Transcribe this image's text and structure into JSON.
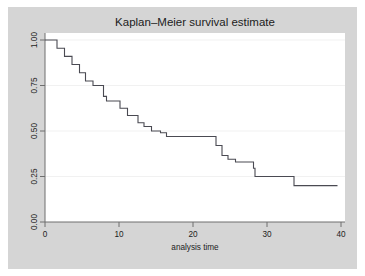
{
  "figure": {
    "title": "Kaplan–Meier survival estimate",
    "background_color": "#d5d5d5",
    "plot_area_color": "#ffffff",
    "outer_margin_color": "#ffffff"
  },
  "axes": {
    "x": {
      "label": "analysis time",
      "ticks": [
        "0",
        "10",
        "20",
        "30",
        "40"
      ],
      "tick_values": [
        0,
        10,
        20,
        30,
        40
      ],
      "range": [
        0,
        40.6
      ]
    },
    "y": {
      "label": "",
      "ticks": [
        "0.00",
        "0.25",
        "0.50",
        "0.75",
        "1.00"
      ],
      "tick_values": [
        0.0,
        0.25,
        0.5,
        0.75,
        1.0
      ],
      "range": [
        0,
        1.0
      ],
      "tick_rotation": "90"
    }
  },
  "style": {
    "line_color": "#4a4a52",
    "grid_color": "#f0f0f0",
    "axis_color": "#6e6e6e",
    "text_color": "#1c1c1c"
  },
  "chart_data": {
    "type": "line",
    "subtype": "kaplan-meier-step",
    "title": "Kaplan–Meier survival estimate",
    "xlabel": "analysis time",
    "ylabel": "",
    "xlim": [
      0,
      40.6
    ],
    "ylim": [
      0,
      1.0
    ],
    "grid": true,
    "grid_axis": "y",
    "legend": "none",
    "step_mode": "post",
    "series": [
      {
        "name": "survival probability",
        "x": [
          0,
          1.0,
          1.6,
          2.6,
          3.6,
          4.6,
          5.4,
          6.4,
          7.8,
          8.2,
          10.0,
          11.0,
          12.4,
          13.2,
          14.2,
          15.4,
          16.2,
          16.8,
          22.0,
          22.8,
          23.6,
          24.4,
          25.4,
          27.8,
          33.0,
          39.0
        ],
        "y": [
          1.0,
          1.0,
          0.955,
          0.91,
          0.865,
          0.82,
          0.775,
          0.75,
          0.69,
          0.665,
          0.625,
          0.585,
          0.545,
          0.525,
          0.5,
          0.49,
          0.47,
          0.47,
          0.47,
          0.42,
          0.365,
          0.345,
          0.33,
          0.295,
          0.25,
          0.2
        ],
        "points": [
          {
            "t": 0,
            "s": 1.0
          },
          {
            "t": 1.0,
            "s": 1.0
          },
          {
            "t": 1.6,
            "s": 0.955
          },
          {
            "t": 2.6,
            "s": 0.91
          },
          {
            "t": 3.6,
            "s": 0.865
          },
          {
            "t": 4.6,
            "s": 0.82
          },
          {
            "t": 5.4,
            "s": 0.775
          },
          {
            "t": 6.4,
            "s": 0.75
          },
          {
            "t": 7.8,
            "s": 0.69
          },
          {
            "t": 8.2,
            "s": 0.665
          },
          {
            "t": 10.0,
            "s": 0.625
          },
          {
            "t": 11.0,
            "s": 0.585
          },
          {
            "t": 12.4,
            "s": 0.545
          },
          {
            "t": 13.2,
            "s": 0.525
          },
          {
            "t": 14.2,
            "s": 0.5
          },
          {
            "t": 15.4,
            "s": 0.49
          },
          {
            "t": 16.2,
            "s": 0.47
          },
          {
            "t": 22.0,
            "s": 0.47
          },
          {
            "t": 22.8,
            "s": 0.42
          },
          {
            "t": 23.6,
            "s": 0.365
          },
          {
            "t": 24.4,
            "s": 0.345
          },
          {
            "t": 25.4,
            "s": 0.33
          },
          {
            "t": 27.8,
            "s": 0.295
          },
          {
            "t": 28.0,
            "s": 0.25
          },
          {
            "t": 33.0,
            "s": 0.25
          },
          {
            "t": 33.2,
            "s": 0.2
          },
          {
            "t": 39.0,
            "s": 0.2
          }
        ]
      }
    ]
  }
}
